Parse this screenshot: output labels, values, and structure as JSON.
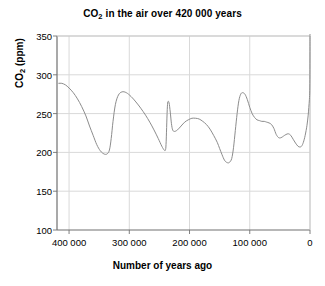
{
  "chart_data": {
    "type": "line",
    "title": "CO2 in the air over 420 000 years",
    "title_main": "CO",
    "title_sub": "2",
    "title_rest": " in the air over 420 000 years",
    "xlabel": "Number of years ago",
    "ylabel": "CO2 (ppm)",
    "ylabel_main": "CO",
    "ylabel_sub": "2",
    "ylabel_rest": " (ppm)",
    "xlim": [
      420000,
      0
    ],
    "ylim": [
      100,
      350
    ],
    "xticks": [
      400000,
      300000,
      200000,
      100000,
      0
    ],
    "xtick_labels": [
      "400 000",
      "300 000",
      "200 000",
      "100 000",
      "0"
    ],
    "yticks": [
      100,
      150,
      200,
      250,
      300,
      350
    ],
    "ytick_labels": [
      "100",
      "150",
      "200",
      "250",
      "300",
      "350"
    ],
    "grid": true,
    "grid_color": "#d9d9d9",
    "axis_color": "#808080",
    "line_color": "#8c8c8c",
    "line_width": 1,
    "legend": null,
    "series": [
      {
        "name": "CO2 concentration",
        "x": [
          417000,
          412000,
          406000,
          400000,
          393000,
          386000,
          379000,
          372000,
          366000,
          360000,
          354000,
          348000,
          342000,
          337000,
          333000,
          330000,
          327000,
          323000,
          318000,
          312000,
          305000,
          297000,
          289000,
          281000,
          273000,
          266000,
          259000,
          252000,
          246000,
          242000,
          240000,
          239000,
          238000,
          237000,
          236000,
          234000,
          232000,
          230000,
          228000,
          225000,
          220000,
          214000,
          208000,
          202000,
          196000,
          190000,
          184000,
          178000,
          172000,
          166000,
          160000,
          154000,
          150000,
          146000,
          142000,
          138000,
          134000,
          130000,
          127000,
          124000,
          121000,
          118000,
          115000,
          112000,
          108000,
          104000,
          100000,
          96000,
          92000,
          88000,
          84000,
          80000,
          76000,
          72000,
          68000,
          64000,
          60000,
          56000,
          52000,
          48000,
          44000,
          40000,
          36000,
          32000,
          28000,
          24000,
          20000,
          17000,
          14000,
          11000,
          8000,
          5000,
          3000,
          2000,
          1000,
          400,
          150,
          50,
          0
        ],
        "y": [
          289,
          289,
          287,
          283,
          277,
          269,
          259,
          247,
          234,
          222,
          210,
          202,
          198,
          198,
          203,
          218,
          240,
          262,
          274,
          278,
          277,
          272,
          265,
          257,
          248,
          239,
          229,
          218,
          208,
          203,
          203,
          210,
          232,
          255,
          265,
          264,
          252,
          237,
          229,
          227,
          229,
          234,
          239,
          242,
          244,
          244,
          243,
          240,
          236,
          230,
          222,
          213,
          205,
          197,
          190,
          187,
          187,
          192,
          206,
          228,
          250,
          267,
          275,
          277,
          275,
          268,
          258,
          250,
          245,
          242,
          241,
          240,
          240,
          239,
          238,
          236,
          231,
          223,
          219,
          219,
          221,
          223,
          224,
          222,
          217,
          212,
          208,
          207,
          208,
          213,
          222,
          235,
          248,
          258,
          268,
          280,
          300,
          330,
          352
        ]
      }
    ]
  },
  "axes": {
    "plot_left_px": 57,
    "plot_right_px": 310,
    "plot_top_px": 36,
    "plot_bottom_px": 230
  }
}
